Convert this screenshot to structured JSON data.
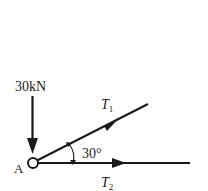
{
  "diagram": {
    "point_label": "A",
    "load": {
      "label": "30kN",
      "direction": "down"
    },
    "forces": [
      {
        "id": "T1",
        "symbol": "T",
        "subscript": "1",
        "angle_deg": 30
      },
      {
        "id": "T2",
        "symbol": "T",
        "subscript": "2",
        "angle_deg": 0
      }
    ],
    "angle_label": "30°",
    "colors": {
      "stroke": "#1a1a1a",
      "background": "#ffffff"
    }
  }
}
